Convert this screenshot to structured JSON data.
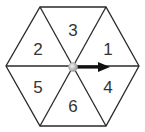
{
  "diagram": {
    "shape": "regular hexagon divided into 6 triangles",
    "sectors": [
      {
        "label": "1",
        "x": 108,
        "y": 49
      },
      {
        "label": "2",
        "x": 38,
        "y": 49
      },
      {
        "label": "3",
        "x": 73,
        "y": 30
      },
      {
        "label": "4",
        "x": 108,
        "y": 87
      },
      {
        "label": "5",
        "x": 38,
        "y": 87
      },
      {
        "label": "6",
        "x": 73,
        "y": 106
      }
    ],
    "spinner": {
      "pivot": "center",
      "arrow_direction": "right"
    },
    "colors": {
      "stroke": "#2a2a2a",
      "arrow": "#111111",
      "pivot": "#c8c8c8",
      "text": "#333333"
    }
  }
}
